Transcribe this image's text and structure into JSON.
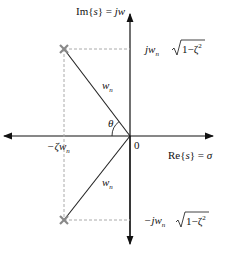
{
  "diagram": {
    "axes": {
      "imag_label_prefix": "Im{",
      "imag_label_var": "s",
      "imag_label_suffix": "} = ",
      "imag_label_value": "jw",
      "real_label_prefix": "Re{",
      "real_label_var": "s",
      "real_label_suffix": "} = ",
      "real_label_value": "σ",
      "origin_label": "0"
    },
    "labels": {
      "upper_imag": "jw",
      "lower_imag": "−jw",
      "subscript_n": "n",
      "sqrt_body": "1−ζ",
      "sq": "2",
      "real_part": "−ζw",
      "vector_label": "w",
      "angle": "θ"
    },
    "poles": [
      {
        "name": "upper-pole",
        "marker": "×"
      },
      {
        "name": "lower-pole",
        "marker": "×"
      }
    ],
    "colors": {
      "axis": "#111111",
      "vector": "#222222",
      "dashed": "#aaaaaa",
      "pole": "#888888"
    }
  }
}
